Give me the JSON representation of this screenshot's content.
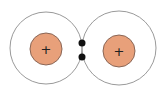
{
  "diagram": {
    "type": "covalent-bond",
    "atoms": [
      {
        "id": "left",
        "cx": 46,
        "cy": 48,
        "shell_r": 36,
        "nucleus_cy": 49,
        "nucleus_r": 16,
        "charge": "+"
      },
      {
        "id": "right",
        "cx": 119,
        "cy": 48,
        "shell_r": 37,
        "nucleus_cy": 51,
        "nucleus_r": 16,
        "charge": "+"
      }
    ],
    "shared_electrons": [
      {
        "cx": 82,
        "cy": 43,
        "r": 3.5
      },
      {
        "cx": 82,
        "cy": 57,
        "r": 3.5
      }
    ],
    "colors": {
      "background": "#ffffff",
      "shell": "#9a9a9a",
      "nucleus_fill": "#E8A07A",
      "nucleus_stroke": "#8a6656",
      "charge": "#222222",
      "electron": "#111111"
    }
  }
}
